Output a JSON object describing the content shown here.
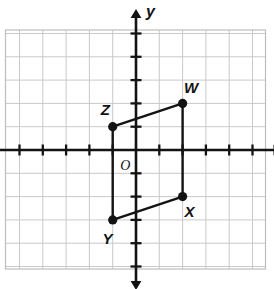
{
  "figure": {
    "title": "",
    "origin_label": "O",
    "axis_labels": {
      "x": "x",
      "y": "y"
    }
  },
  "colors": {
    "grid_line": "#c9c9c9",
    "grid_border": "#bdbdbd",
    "axis": "#131313",
    "shape_stroke": "#131313",
    "point_fill": "#131313",
    "background": "#ffffff"
  },
  "chart_data": {
    "type": "scatter",
    "title": "",
    "xlabel": "x",
    "ylabel": "y",
    "grid": true,
    "legend": "none",
    "xlim": [
      -5,
      5
    ],
    "ylim": [
      -5,
      5
    ],
    "xticks": [
      -5,
      -4,
      -3,
      -2,
      -1,
      0,
      1,
      2,
      3,
      4,
      5
    ],
    "yticks": [
      -5,
      -4,
      -3,
      -2,
      -1,
      0,
      1,
      2,
      3,
      4,
      5
    ],
    "xticklabels": [
      "",
      "",
      "",
      "",
      "",
      "",
      "",
      "",
      "",
      "",
      ""
    ],
    "yticklabels": [
      "",
      "",
      "",
      "",
      "",
      "",
      "",
      "",
      "",
      "",
      ""
    ],
    "annotations": [
      {
        "text": "O",
        "x": -0.55,
        "y": -0.75
      }
    ],
    "series": [
      {
        "name": "parallelogram WXYZ",
        "closed": true,
        "points": [
          {
            "label": "W",
            "x": 2,
            "y": 2,
            "label_dx": 0.28,
            "label_dy": 0.72
          },
          {
            "label": "X",
            "x": 2,
            "y": -2,
            "label_dx": 0.3,
            "label_dy": -0.62
          },
          {
            "label": "Y",
            "x": -1,
            "y": -3,
            "label_dx": -0.22,
            "label_dy": -0.78
          },
          {
            "label": "Z",
            "x": -1,
            "y": 1,
            "label_dx": -0.3,
            "label_dy": 0.78
          }
        ]
      }
    ]
  }
}
